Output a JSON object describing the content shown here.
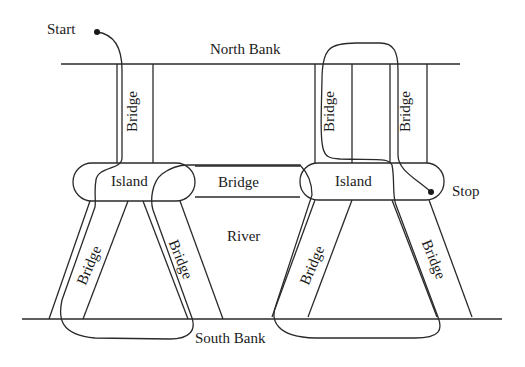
{
  "diagram": {
    "type": "Königsberg-style bridge route diagram",
    "labels": {
      "start": "Start",
      "stop": "Stop",
      "north_bank": "North Bank",
      "south_bank": "South Bank",
      "river": "River",
      "island_left": "Island",
      "island_right": "Island",
      "bridge": "Bridge"
    },
    "bridges": [
      {
        "id": "north-left",
        "label": "Bridge",
        "connects": [
          "North Bank",
          "Left Island"
        ]
      },
      {
        "id": "north-right-a",
        "label": "Bridge",
        "connects": [
          "North Bank",
          "Right Island"
        ]
      },
      {
        "id": "north-right-b",
        "label": "Bridge",
        "connects": [
          "North Bank",
          "Right Island"
        ]
      },
      {
        "id": "middle",
        "label": "Bridge",
        "connects": [
          "Left Island",
          "Right Island"
        ]
      },
      {
        "id": "south-left-a",
        "label": "Bridge",
        "connects": [
          "Left Island",
          "South Bank"
        ]
      },
      {
        "id": "south-left-b",
        "label": "Bridge",
        "connects": [
          "Left Island",
          "South Bank"
        ]
      },
      {
        "id": "south-right-a",
        "label": "Bridge",
        "connects": [
          "Right Island",
          "South Bank"
        ]
      },
      {
        "id": "south-right-b",
        "label": "Bridge",
        "connects": [
          "Right Island",
          "South Bank"
        ]
      }
    ],
    "colors": {
      "stroke": "#2a2a2a",
      "background": "#ffffff"
    }
  }
}
